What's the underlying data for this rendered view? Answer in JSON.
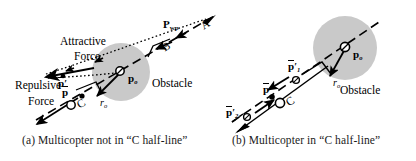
{
  "figure": {
    "width": 416,
    "height": 161,
    "background": "#ffffff"
  },
  "colors": {
    "stroke": "#000000",
    "obstacle_fill": "#c9c9c9",
    "text": "#000000",
    "caption": "#1a1a1a"
  },
  "panel_a": {
    "caption": "(a) Multicopter not in  “C half-line”",
    "labels": {
      "p_wp": "P",
      "p_wp_sub": "wp",
      "attractive_line1": "Attractive",
      "attractive_line2": "Force",
      "repulsive_line1": "Repulsive",
      "repulsive_line2": "Force",
      "obstacle": "Obstacle",
      "p_o": "p",
      "p_o_sub": "o",
      "r_o": "r",
      "r_o_sub": "o",
      "p_bar_prime": "p",
      "p_bar_prime_mark": "′",
      "p_bar": "p",
      "point_A": "A",
      "point_B": "B",
      "point_C": "C"
    }
  },
  "panel_b": {
    "caption": "(b) Multicopter in  “C half-line”",
    "labels": {
      "obstacle": "Obstacle",
      "p_o": "p",
      "p_o_sub": "o",
      "r_o": "r",
      "r_o_sub": "o",
      "p_bar_prime_1": "p",
      "p_bar_prime_1_mark": "′",
      "p_bar_prime_1_sub": "1",
      "p_bar": "p",
      "p_bar_prime_2": "p",
      "p_bar_prime_2_mark": "′",
      "p_bar_prime_2_sub": "2",
      "point_C": "C"
    }
  }
}
